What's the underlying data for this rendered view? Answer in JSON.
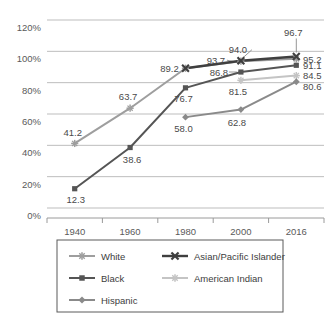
{
  "chart_data": {
    "type": "line",
    "title": "",
    "xlabel": "",
    "ylabel": "",
    "categories": [
      "1940",
      "1960",
      "1980",
      "2000",
      "2016"
    ],
    "x_tick_labels": [
      "1940",
      "1960",
      "1980",
      "2000",
      "2016"
    ],
    "y_tick_labels": [
      "0%",
      "20%",
      "40%",
      "60%",
      "80%",
      "100%",
      "120%"
    ],
    "y_tick_values": [
      0,
      20,
      40,
      60,
      80,
      100,
      120
    ],
    "ylim": [
      0,
      120
    ],
    "grid": true,
    "legend_position": "bottom",
    "series": [
      {
        "name": "White",
        "color": "#9e9e9e",
        "marker": "star",
        "x": [
          "1940",
          "1960",
          "1980",
          "2000",
          "2016"
        ],
        "values": [
          41.2,
          63.7,
          89.2,
          93.7,
          95.2
        ],
        "labels": [
          "41.2",
          "63.7",
          "89.2",
          "93.7",
          "95.2"
        ]
      },
      {
        "name": "Asian/Pacific Islander",
        "color": "#3f3f3f",
        "marker": "x",
        "x": [
          "1980",
          "2000",
          "2016"
        ],
        "values": [
          89.2,
          94.0,
          96.7
        ],
        "labels": [
          "",
          "94.0",
          "96.7"
        ]
      },
      {
        "name": "Black",
        "color": "#555555",
        "marker": "square",
        "x": [
          "1940",
          "1960",
          "1980",
          "2000",
          "2016"
        ],
        "values": [
          12.3,
          38.6,
          76.7,
          86.8,
          91.1
        ],
        "labels": [
          "12.3",
          "38.6",
          "76.7",
          "86.8",
          "91.1"
        ]
      },
      {
        "name": "American Indian",
        "color": "#c4c4c4",
        "marker": "star",
        "x": [
          "2000",
          "2016"
        ],
        "values": [
          81.5,
          84.5
        ],
        "labels": [
          "81.5",
          "84.5"
        ]
      },
      {
        "name": "Hispanic",
        "color": "#8a8a8a",
        "marker": "diamond",
        "x": [
          "1980",
          "2000",
          "2016"
        ],
        "values": [
          58.0,
          62.8,
          80.6
        ],
        "labels": [
          "58.0",
          "62.8",
          "80.6"
        ]
      }
    ],
    "legend": [
      {
        "label": "White",
        "color": "#9e9e9e",
        "marker": "star"
      },
      {
        "label": "Asian/Pacific Islander",
        "color": "#3f3f3f",
        "marker": "x"
      },
      {
        "label": "Black",
        "color": "#555555",
        "marker": "square"
      },
      {
        "label": "American Indian",
        "color": "#c4c4c4",
        "marker": "star"
      },
      {
        "label": "Hispanic",
        "color": "#8a8a8a",
        "marker": "diamond"
      }
    ],
    "annotations": [
      {
        "text": "41.2",
        "series": "White",
        "x": "1940"
      },
      {
        "text": "63.7",
        "series": "White",
        "x": "1960"
      },
      {
        "text": "89.2",
        "series": "White",
        "x": "1980"
      },
      {
        "text": "93.7",
        "series": "White",
        "x": "2000"
      },
      {
        "text": "95.2",
        "series": "White",
        "x": "2016"
      },
      {
        "text": "94.0",
        "series": "Asian/Pacific Islander",
        "x": "2000"
      },
      {
        "text": "96.7",
        "series": "Asian/Pacific Islander",
        "x": "2016"
      },
      {
        "text": "12.3",
        "series": "Black",
        "x": "1940"
      },
      {
        "text": "38.6",
        "series": "Black",
        "x": "1960"
      },
      {
        "text": "76.7",
        "series": "Black",
        "x": "1980"
      },
      {
        "text": "86.8",
        "series": "Black",
        "x": "2000"
      },
      {
        "text": "91.1",
        "series": "Black",
        "x": "2016"
      },
      {
        "text": "81.5",
        "series": "American Indian",
        "x": "2000"
      },
      {
        "text": "84.5",
        "series": "American Indian",
        "x": "2016"
      },
      {
        "text": "58.0",
        "series": "Hispanic",
        "x": "1980"
      },
      {
        "text": "62.8",
        "series": "Hispanic",
        "x": "2000"
      },
      {
        "text": "80.6",
        "series": "Hispanic",
        "x": "2016"
      }
    ]
  }
}
